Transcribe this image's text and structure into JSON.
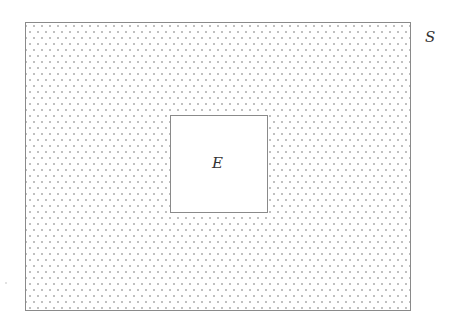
{
  "diagram": {
    "type": "venn-set-complement",
    "universe": {
      "label": "S",
      "fill": "dotted",
      "rect": {
        "x": 25,
        "y": 22,
        "width": 385,
        "height": 288
      }
    },
    "subset": {
      "label": "E",
      "fill": "none",
      "rect": {
        "x": 170,
        "y": 115,
        "width": 97,
        "height": 97
      }
    },
    "colors": {
      "border": "#8a8a8a",
      "dots": "#6e6e6e",
      "background": "#ffffff",
      "label": "#333333"
    }
  }
}
